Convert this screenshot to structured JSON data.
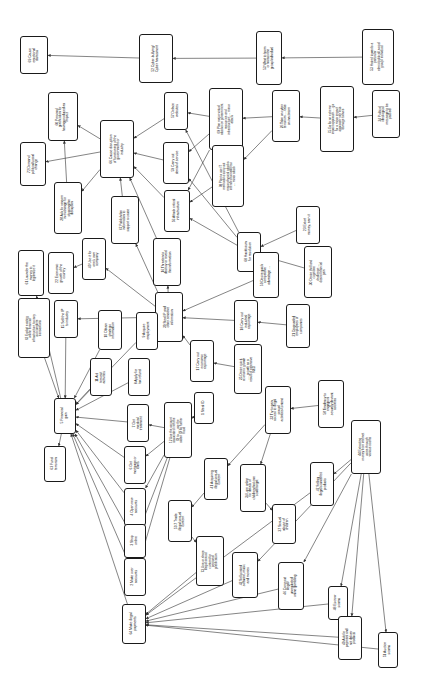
{
  "diagram": {
    "orientation": "rotated-90-ccw",
    "background_color": "#ffffff",
    "node_border_color": "#1a1a1a",
    "edge_color": "#333333",
    "nodes": [
      {
        "id": "n69",
        "label": "69 Cause emotional distress",
        "x": 20,
        "y": 36,
        "w": 28,
        "h": 38,
        "fs": 3.5
      },
      {
        "id": "n52",
        "label": "52 Cyber-bullying/ Cyber harassment",
        "x": 139,
        "y": 34,
        "w": 34,
        "h": 49,
        "fs": 3.5
      },
      {
        "id": "n53",
        "label": "53 Want to harm or harass the group/individual",
        "x": 256,
        "y": 31,
        "w": 26,
        "h": 54,
        "fs": 3.4
      },
      {
        "id": "n32",
        "label": "53 Hatred towards a particular ethnic/political/ social group/ individual",
        "x": 362,
        "y": 29,
        "w": 32,
        "h": 56,
        "fs": 3.3
      },
      {
        "id": "n60",
        "label": "60 Personal gratification for having produced an impact",
        "x": 48,
        "y": 92,
        "w": 30,
        "h": 49,
        "fs": 3.4
      },
      {
        "id": "n72",
        "label": "72 Demand political/social change",
        "x": 20,
        "y": 142,
        "w": 26,
        "h": 44,
        "fs": 3.5
      },
      {
        "id": "n66",
        "label": "66 Cause disruption of functioning of the government or industry",
        "x": 100,
        "y": 120,
        "w": 34,
        "h": 58,
        "fs": 3.5
      },
      {
        "id": "n57",
        "label": "57 Deface websites",
        "x": 164,
        "y": 92,
        "w": 24,
        "h": 38,
        "fs": 3.5
      },
      {
        "id": "n69b",
        "label": "69 Plan major virtual attacks on government resources and infrastructure .... minor attack",
        "x": 209,
        "y": 88,
        "w": 34,
        "h": 62,
        "fs": 3.3
      },
      {
        "id": "n26",
        "label": "26 Take on cyber terrorism .... take on inactivism",
        "x": 272,
        "y": 90,
        "w": 28,
        "h": 52,
        "fs": 3.4
      },
      {
        "id": "n75",
        "label": "75 Go for an extreme impact approach .... go for a minor impact approach with less damage to lives",
        "x": 320,
        "y": 86,
        "w": 34,
        "h": 66,
        "fs": 3.2
      },
      {
        "id": "n24",
        "label": "24 Political ideological message to be passed",
        "x": 372,
        "y": 90,
        "w": 28,
        "h": 48,
        "fs": 3.4
      },
      {
        "id": "n28",
        "label": "28 Ask for ransom in exchange for stopping the disruption",
        "x": 54,
        "y": 182,
        "w": 28,
        "h": 52,
        "fs": 3.4
      },
      {
        "id": "n59",
        "label": "59 Carry out denial of service",
        "x": 163,
        "y": 142,
        "w": 26,
        "h": 42,
        "fs": 3.5
      },
      {
        "id": "n56",
        "label": "56 Attack critical infrastructure",
        "x": 164,
        "y": 190,
        "w": 26,
        "h": 42,
        "fs": 3.5
      },
      {
        "id": "n70",
        "label": "70 Plan to use IT methods to carry out major physical attacks intended to instill fear .... minor attack",
        "x": 212,
        "y": 145,
        "w": 32,
        "h": 62,
        "fs": 3.2
      },
      {
        "id": "n67",
        "label": "67 Publish the information to support a cause",
        "x": 111,
        "y": 196,
        "w": 28,
        "h": 48,
        "fs": 3.4
      },
      {
        "id": "n40",
        "label": "40 Use it for one's own company",
        "x": 82,
        "y": 238,
        "w": 24,
        "h": 42,
        "fs": 3.5
      },
      {
        "id": "n16",
        "label": "16 Threaten to destroy or reveal the information",
        "x": 153,
        "y": 238,
        "w": 28,
        "h": 48,
        "fs": 3.4
      },
      {
        "id": "n68",
        "label": "68 Hacktivism for resolution",
        "x": 237,
        "y": 232,
        "w": 24,
        "h": 40,
        "fs": 3.5
      },
      {
        "id": "n23",
        "label": "23 Extort money, earn it",
        "x": 296,
        "y": 206,
        "w": 24,
        "h": 38,
        "fs": 3.5
      },
      {
        "id": "n22",
        "label": "22 Economic growth of the country",
        "x": 48,
        "y": 252,
        "w": 26,
        "h": 42,
        "fs": 3.5
      },
      {
        "id": "n61",
        "label": "61 Launder the money to legitimize it",
        "x": 18,
        "y": 250,
        "w": 26,
        "h": 46,
        "fs": 3.5
      },
      {
        "id": "n39",
        "label": "39 Steal IP and other sensitive information",
        "x": 155,
        "y": 292,
        "w": 28,
        "h": 50,
        "fs": 3.4
      },
      {
        "id": "n59b",
        "label": "59 Desire quick competitive advantage ....",
        "x": 253,
        "y": 252,
        "w": 26,
        "h": 46,
        "fs": 3.4
      },
      {
        "id": "n30",
        "label": "30 Desire thrill and cognitive challenge .... desire financial gain",
        "x": 304,
        "y": 246,
        "w": 28,
        "h": 52,
        "fs": 3.3
      },
      {
        "id": "n15",
        "label": "15 Sell the IP to industry",
        "x": 54,
        "y": 300,
        "w": 24,
        "h": 38,
        "fs": 3.5
      },
      {
        "id": "n62",
        "label": "62 Exploit existing online financial infrastructure to carry out complete transactions",
        "x": 18,
        "y": 298,
        "w": 32,
        "h": 60,
        "fs": 3.2
      },
      {
        "id": "n10",
        "label": "10 Obtain strategic information",
        "x": 98,
        "y": 310,
        "w": 24,
        "h": 40,
        "fs": 3.5
      },
      {
        "id": "n9",
        "label": "9 Acquire employment",
        "x": 136,
        "y": 312,
        "w": 22,
        "h": 38,
        "fs": 3.5
      },
      {
        "id": "n18",
        "label": "18 Carry out industrial espionage",
        "x": 234,
        "y": 300,
        "w": 24,
        "h": 42,
        "fs": 3.5
      },
      {
        "id": "n21",
        "label": "21 Disgruntled employees of companies",
        "x": 286,
        "y": 304,
        "w": 24,
        "h": 44,
        "fs": 3.4
      },
      {
        "id": "n17",
        "label": "17 Carry out economic espionage",
        "x": 190,
        "y": 340,
        "w": 24,
        "h": 42,
        "fs": 3.5
      },
      {
        "id": "n25",
        "label": "25 Desire quick economic growth .... growth as a result of extensive R&D",
        "x": 234,
        "y": 344,
        "w": 28,
        "h": 50,
        "fs": 3.3
      },
      {
        "id": "n11",
        "label": "11 Aid terrorist activities",
        "x": 90,
        "y": 358,
        "w": 22,
        "h": 38,
        "fs": 3.5
      },
      {
        "id": "n8",
        "label": "8 Apply for tax refund",
        "x": 128,
        "y": 358,
        "w": 22,
        "h": 38,
        "fs": 3.5
      },
      {
        "id": "n1",
        "label": "1 Steal ID",
        "x": 194,
        "y": 392,
        "w": 20,
        "h": 32,
        "fs": 3.5
      },
      {
        "id": "n33",
        "label": "33 Try to gain access to illegal sexual activities/content",
        "x": 265,
        "y": 386,
        "w": 26,
        "h": 48,
        "fs": 3.4
      },
      {
        "id": "n58",
        "label": "58 Tendency to engage in sexually deviant activities",
        "x": 318,
        "y": 380,
        "w": 26,
        "h": 48,
        "fs": 3.4
      },
      {
        "id": "n5",
        "label": "5 Financial gain",
        "x": 54,
        "y": 398,
        "w": 22,
        "h": 36,
        "fs": 3.5
      },
      {
        "id": "n7",
        "label": "7 Get medical treatment",
        "x": 127,
        "y": 404,
        "w": 22,
        "h": 38,
        "fs": 3.5
      },
      {
        "id": "n12",
        "label": "12 Use the account associated with the ID to ..... use the stolen ID for further fraud",
        "x": 164,
        "y": 402,
        "w": 28,
        "h": 56,
        "fs": 3.2
      },
      {
        "id": "n44",
        "label": "44 Extracting money from internet users through various scams",
        "x": 351,
        "y": 420,
        "w": 30,
        "h": 54,
        "fs": 3.3
      },
      {
        "id": "n63",
        "label": "63 Fund terrorism",
        "x": 44,
        "y": 446,
        "w": 22,
        "h": 36,
        "fs": 3.5
      },
      {
        "id": "n6",
        "label": "6 Get mortgage or loans",
        "x": 124,
        "y": 446,
        "w": 22,
        "h": 38,
        "fs": 3.5
      },
      {
        "id": "n41",
        "label": "41 Acquiring illegal sexual content",
        "x": 204,
        "y": 458,
        "w": 24,
        "h": 42,
        "fs": 3.5
      },
      {
        "id": "n34",
        "label": "34 Lure online for details of children that one could target",
        "x": 240,
        "y": 464,
        "w": 26,
        "h": 48,
        "fs": 3.4
      },
      {
        "id": "n47",
        "label": "47 Selling illegal/counterfeit products",
        "x": 310,
        "y": 462,
        "w": 24,
        "h": 44,
        "fs": 3.4
      },
      {
        "id": "n4",
        "label": "4 Open new accounts",
        "x": 124,
        "y": 488,
        "w": 22,
        "h": 38,
        "fs": 3.5
      },
      {
        "id": "n50",
        "label": "50 7 Trade illegal sexual content",
        "x": 168,
        "y": 500,
        "w": 24,
        "h": 42,
        "fs": 3.5
      },
      {
        "id": "n37",
        "label": "37 Sexual abuse of children",
        "x": 272,
        "y": 504,
        "w": 24,
        "h": 40,
        "fs": 3.5
      },
      {
        "id": "n3",
        "label": "3 Shop online",
        "x": 124,
        "y": 524,
        "w": 22,
        "h": 34,
        "fs": 3.5
      },
      {
        "id": "n73",
        "label": "73 Use or share illegal sexual content for personal gratification",
        "x": 196,
        "y": 536,
        "w": 28,
        "h": 50,
        "fs": 3.3
      },
      {
        "id": "n2",
        "label": "2 Make over accounts",
        "x": 124,
        "y": 558,
        "w": 22,
        "h": 38,
        "fs": 3.5
      },
      {
        "id": "n42",
        "label": "42 Sell pirated software, music and movies",
        "x": 232,
        "y": 552,
        "w": 26,
        "h": 46,
        "fs": 3.4
      },
      {
        "id": "n46",
        "label": "46 Carry out illegal/ unregulated online gambling",
        "x": 278,
        "y": 562,
        "w": 26,
        "h": 48,
        "fs": 3.4
      },
      {
        "id": "n64",
        "label": "64 Make illegal payments",
        "x": 122,
        "y": 604,
        "w": 24,
        "h": 40,
        "fs": 3.5
      },
      {
        "id": "n48",
        "label": "48 Escrow scams",
        "x": 328,
        "y": 586,
        "w": 20,
        "h": 34,
        "fs": 3.5
      },
      {
        "id": "n49",
        "label": "49 Ask for payment and not deliver products",
        "x": 338,
        "y": 616,
        "w": 24,
        "h": 44,
        "fs": 3.4
      },
      {
        "id": "n51",
        "label": "51 Auction scams",
        "x": 378,
        "y": 632,
        "w": 20,
        "h": 36,
        "fs": 3.5
      }
    ],
    "edges": [
      {
        "from": "n52",
        "to": "n69"
      },
      {
        "from": "n53",
        "to": "n52"
      },
      {
        "from": "n32",
        "to": "n53"
      },
      {
        "from": "n66",
        "to": "n60"
      },
      {
        "from": "n66",
        "to": "n72"
      },
      {
        "from": "n28",
        "to": "n60"
      },
      {
        "from": "n66",
        "to": "n28"
      },
      {
        "from": "n57",
        "to": "n66"
      },
      {
        "from": "n59",
        "to": "n66"
      },
      {
        "from": "n56",
        "to": "n66"
      },
      {
        "from": "n67",
        "to": "n66"
      },
      {
        "from": "n69b",
        "to": "n57"
      },
      {
        "from": "n69b",
        "to": "n59"
      },
      {
        "from": "n69b",
        "to": "n56"
      },
      {
        "from": "n26",
        "to": "n69b"
      },
      {
        "from": "n75",
        "to": "n26"
      },
      {
        "from": "n24",
        "to": "n75"
      },
      {
        "from": "n70",
        "to": "n56"
      },
      {
        "from": "n26",
        "to": "n70"
      },
      {
        "from": "n39",
        "to": "n67"
      },
      {
        "from": "n39",
        "to": "n16"
      },
      {
        "from": "n39",
        "to": "n40"
      },
      {
        "from": "n40",
        "to": "n22"
      },
      {
        "from": "n16",
        "to": "n66"
      },
      {
        "from": "n68",
        "to": "n57"
      },
      {
        "from": "n68",
        "to": "n59"
      },
      {
        "from": "n68",
        "to": "n56"
      },
      {
        "from": "n23",
        "to": "n68"
      },
      {
        "from": "n59b",
        "to": "n39"
      },
      {
        "from": "n30",
        "to": "n68"
      },
      {
        "from": "n18",
        "to": "n39"
      },
      {
        "from": "n17",
        "to": "n39"
      },
      {
        "from": "n21",
        "to": "n18"
      },
      {
        "from": "n25",
        "to": "n17"
      },
      {
        "from": "n15",
        "to": "n5"
      },
      {
        "from": "n62",
        "to": "n5"
      },
      {
        "from": "n10",
        "to": "n5"
      },
      {
        "from": "n9",
        "to": "n5"
      },
      {
        "from": "n11",
        "to": "n5"
      },
      {
        "from": "n8",
        "to": "n5"
      },
      {
        "from": "n7",
        "to": "n5"
      },
      {
        "from": "n6",
        "to": "n5"
      },
      {
        "from": "n4",
        "to": "n5"
      },
      {
        "from": "n3",
        "to": "n5"
      },
      {
        "from": "n2",
        "to": "n5"
      },
      {
        "from": "n39",
        "to": "n15"
      },
      {
        "from": "n5",
        "to": "n63"
      },
      {
        "from": "n5",
        "to": "n61"
      },
      {
        "from": "n1",
        "to": "n12"
      },
      {
        "from": "n12",
        "to": "n6"
      },
      {
        "from": "n12",
        "to": "n4"
      },
      {
        "from": "n12",
        "to": "n3"
      },
      {
        "from": "n12",
        "to": "n2"
      },
      {
        "from": "n12",
        "to": "n7"
      },
      {
        "from": "n33",
        "to": "n41"
      },
      {
        "from": "n33",
        "to": "n34"
      },
      {
        "from": "n58",
        "to": "n33"
      },
      {
        "from": "n41",
        "to": "n50"
      },
      {
        "from": "n34",
        "to": "n37"
      },
      {
        "from": "n50",
        "to": "n73"
      },
      {
        "from": "n44",
        "to": "n47"
      },
      {
        "from": "n44",
        "to": "n42"
      },
      {
        "from": "n44",
        "to": "n46"
      },
      {
        "from": "n44",
        "to": "n48"
      },
      {
        "from": "n44",
        "to": "n49"
      },
      {
        "from": "n44",
        "to": "n51"
      },
      {
        "from": "n64",
        "to": "n5"
      },
      {
        "from": "n42",
        "to": "n64"
      },
      {
        "from": "n46",
        "to": "n64"
      },
      {
        "from": "n48",
        "to": "n64"
      },
      {
        "from": "n49",
        "to": "n64"
      },
      {
        "from": "n51",
        "to": "n64"
      },
      {
        "from": "n47",
        "to": "n64"
      },
      {
        "from": "n73",
        "to": "n64"
      }
    ]
  }
}
